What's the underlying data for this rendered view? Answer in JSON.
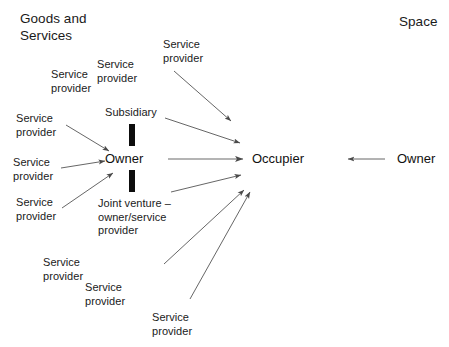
{
  "diagram": {
    "title_left": "Goods and\nServices",
    "title_right": "Space",
    "nodes": {
      "owner_center": "Owner",
      "occupier": "Occupier",
      "owner_right": "Owner",
      "subsidiary": "Subsidiary",
      "joint_venture": "Joint venture –\nowner/service\nprovider"
    },
    "labels": [
      {
        "id": "sp-topright",
        "text": "Service\nprovider"
      },
      {
        "id": "sp-upper-mid",
        "text": "Service\nprovider"
      },
      {
        "id": "sp-upper-left",
        "text": "Service\nprovider"
      },
      {
        "id": "sp-left-1",
        "text": "Service\nprovider"
      },
      {
        "id": "sp-left-2",
        "text": "Service\nprovider"
      },
      {
        "id": "sp-left-3",
        "text": "Service\nprovider"
      },
      {
        "id": "sp-bottom-left",
        "text": "Service\nprovider"
      },
      {
        "id": "sp-bottom-mid",
        "text": "Service\nprovider"
      },
      {
        "id": "sp-bottom-right",
        "text": "Service\nprovider"
      }
    ],
    "colors": {
      "line": "#555555",
      "bar": "#0d0d0d",
      "text": "#1a1a1a",
      "background": "#ffffff"
    },
    "connector_counts": {
      "arrows_into_owner": 3,
      "arrows_into_occupier": 6,
      "thick_bars": 2
    }
  }
}
